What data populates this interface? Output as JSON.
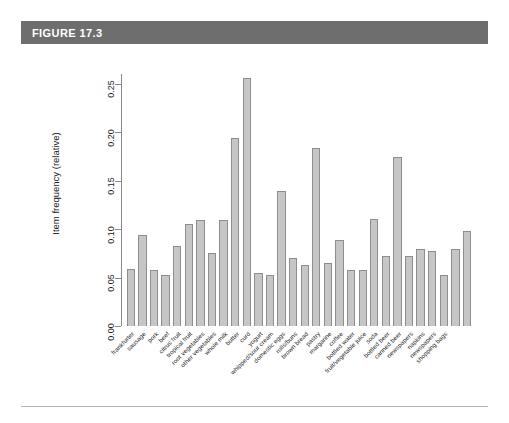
{
  "figure": {
    "label": "FIGURE 17.3",
    "header_bg": "#6e6e6e",
    "header_text_color": "#ffffff"
  },
  "style": {
    "bar_fill": "#c6c6c6",
    "bar_border": "#8e8e8e",
    "axis_color": "#8a8a8a",
    "rule_color": "#b5b5b5"
  },
  "chart_data": {
    "type": "bar",
    "title": "",
    "subtitle": "",
    "xlabel": "",
    "ylabel": "Item frequency (relative)",
    "ylim": [
      0.0,
      0.26
    ],
    "yticks": [
      "0.00",
      "0.05",
      "0.10",
      "0.15",
      "0.20",
      "0.25"
    ],
    "ytick_values": [
      0.0,
      0.05,
      0.1,
      0.15,
      0.2,
      0.25
    ],
    "grid": false,
    "legend": null,
    "categories": [
      "frankfurter",
      "sausage",
      "pork",
      "beef",
      "citrus fruit",
      "tropical fruit",
      "root vegetables",
      "other vegetables",
      "whole milk",
      "butter",
      "curd",
      "yogurt",
      "whipped/sour cream",
      "domestic eggs",
      "rolls/buns",
      "brown bread",
      "pastry",
      "margarine",
      "coffee",
      "bottled water",
      "fruit/vegetable juice",
      "soda",
      "bottled beer",
      "canned beer",
      "newspapers",
      "napkins",
      "newspapers",
      "shopping bags"
    ],
    "values": [
      0.0589,
      0.0939,
      0.0576,
      0.0524,
      0.0828,
      0.1049,
      0.109,
      0.1935,
      0.2555,
      0.0554,
      0.0532,
      0.1395,
      0.0717,
      0.0634,
      0.184,
      0.0649,
      0.0889,
      0.0586,
      0.058,
      0.1105,
      0.0723,
      0.1744,
      0.0805,
      0.0777,
      0.0524,
      0.0792,
      0.0998,
      0.0985
    ],
    "n_bars": 30,
    "bars": [
      {
        "label": "frankfurter",
        "value": 0.0589
      },
      {
        "label": "sausage",
        "value": 0.0939
      },
      {
        "label": "pork",
        "value": 0.0576
      },
      {
        "label": "beef",
        "value": 0.0524
      },
      {
        "label": "citrus fruit",
        "value": 0.0828
      },
      {
        "label": "tropical fruit",
        "value": 0.1049
      },
      {
        "label": "root vegetables",
        "value": 0.109
      },
      {
        "label": "other vegetables",
        "value": 0.0753
      },
      {
        "label": "whole milk",
        "value": 0.109
      },
      {
        "label": "butter",
        "value": 0.1935
      },
      {
        "label": "curd",
        "value": 0.2555
      },
      {
        "label": "yogurt",
        "value": 0.0545
      },
      {
        "label": "whipped/sour cream",
        "value": 0.0529
      },
      {
        "label": "domestic eggs",
        "value": 0.1395
      },
      {
        "label": "rolls/buns",
        "value": 0.0704
      },
      {
        "label": "brown bread",
        "value": 0.0634
      },
      {
        "label": "pastry",
        "value": 0.184
      },
      {
        "label": "margarine",
        "value": 0.0649
      },
      {
        "label": "coffee",
        "value": 0.0889
      },
      {
        "label": "bottled water",
        "value": 0.058
      },
      {
        "label": "fruit/vegetable juice",
        "value": 0.0576
      },
      {
        "label": "soda",
        "value": 0.1105
      },
      {
        "label": "bottled beer",
        "value": 0.0723
      },
      {
        "label": "canned beer",
        "value": 0.1744
      },
      {
        "label": "napkins",
        "value": 0.0723
      },
      {
        "label": "newspapers",
        "value": 0.0798
      },
      {
        "label": "shopping bags",
        "value": 0.0777
      },
      {
        "label": "x",
        "value": 0.0524
      },
      {
        "label": "y",
        "value": 0.0792
      },
      {
        "label": "z",
        "value": 0.0985
      }
    ]
  }
}
